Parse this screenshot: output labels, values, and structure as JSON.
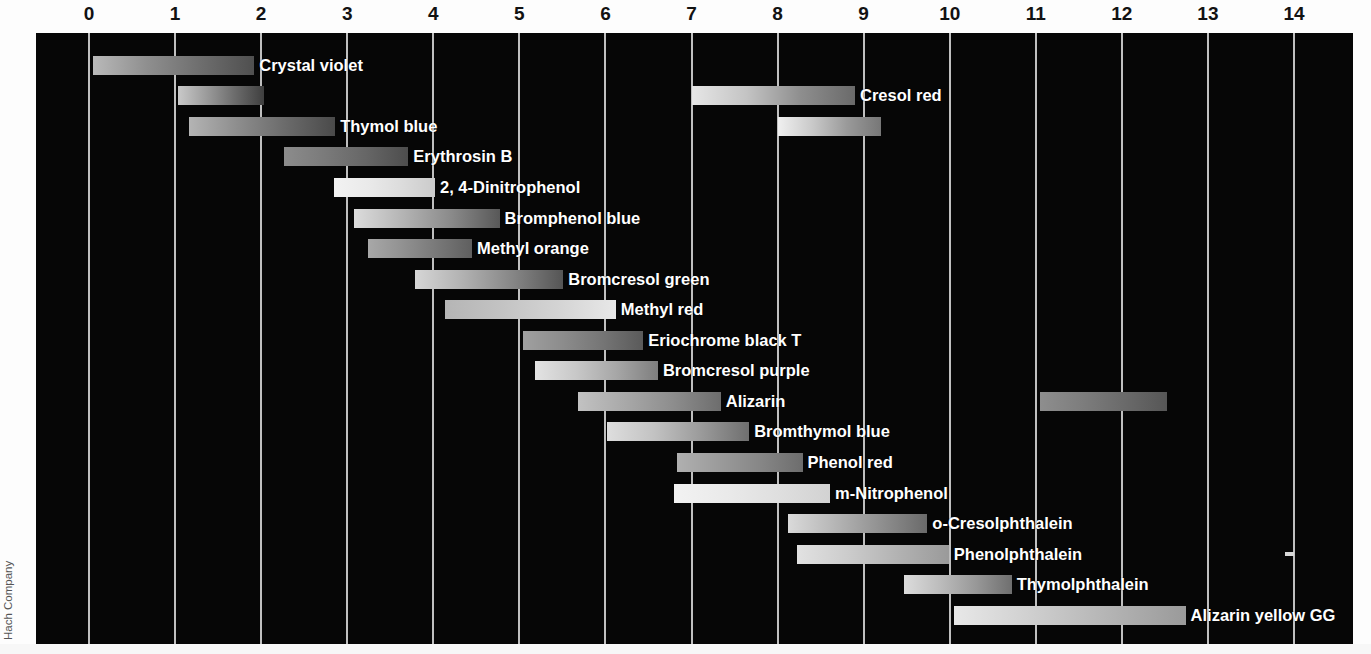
{
  "figure": {
    "credit": "Hach Company",
    "axis": {
      "title": "pH",
      "min": 0,
      "max": 14,
      "ticks": [
        0,
        1,
        2,
        3,
        4,
        5,
        6,
        7,
        8,
        9,
        10,
        11,
        12,
        13,
        14
      ],
      "tick_labels": [
        "0",
        "1",
        "2",
        "3",
        "4",
        "5",
        "6",
        "7",
        "8",
        "9",
        "10",
        "11",
        "12",
        "13",
        "14"
      ],
      "position": "top"
    },
    "colors": {
      "panel_background": "#060606",
      "gridline": "#cfcfcf",
      "label_text": "#ffffff",
      "axis_text": "#121212",
      "credit_text": "#555555"
    }
  },
  "chart_data": {
    "type": "bar",
    "orientation": "horizontal-ranges",
    "title": "",
    "subtitle": "",
    "xlabel": "pH",
    "ylabel": "",
    "xlim": [
      0,
      14
    ],
    "ylim": [
      0,
      20
    ],
    "grid": true,
    "legend": "none",
    "annotations": [
      "Hach Company"
    ],
    "categories": [
      "Crystal violet",
      "Cresol red",
      "Thymol blue",
      "Erythrosin B",
      "2, 4-Dinitrophenol",
      "Bromphenol blue",
      "Methyl orange",
      "Bromcresol green",
      "Methyl red",
      "Eriochrome black T",
      "Bromcresol purple",
      "Alizarin",
      "Bromthymol blue",
      "Phenol red",
      "m-Nitrophenol",
      "o-Cresolphthalein",
      "Phenolphthalein",
      "Thymolphthalein",
      "Alizarin yellow GG"
    ],
    "rows": [
      {
        "label": "Crystal violet",
        "label_side": "right",
        "bands": [
          {
            "start": 0.05,
            "end": 1.92,
            "gradient": [
              "#b9b9b9",
              "#8f8f8f",
              "#6e6e6e",
              "#4f4f4f"
            ]
          }
        ]
      },
      {
        "label": "Cresol red",
        "label_side": "right",
        "bands": [
          {
            "start": 1.03,
            "end": 2.03,
            "gradient": [
              "#c9c9c9",
              "#9b9b9b",
              "#6b6b6b",
              "#3f3f3f"
            ]
          },
          {
            "start": 7.0,
            "end": 8.9,
            "gradient": [
              "#e6e6e6",
              "#c4c4c4",
              "#8e8e8e",
              "#6a6a6a"
            ]
          }
        ]
      },
      {
        "label": "Thymol blue",
        "label_side": "right",
        "bands": [
          {
            "start": 1.16,
            "end": 2.86,
            "gradient": [
              "#b4b4b4",
              "#8d8d8d",
              "#6a6a6a",
              "#4a4a4a"
            ]
          },
          {
            "start": 8.0,
            "end": 9.2,
            "gradient": [
              "#f0f0f0",
              "#c9c9c9",
              "#9a9a9a",
              "#777777"
            ]
          }
        ]
      },
      {
        "label": "Erythrosin B",
        "label_side": "right",
        "bands": [
          {
            "start": 2.26,
            "end": 3.71,
            "gradient": [
              "#8c8c8c",
              "#7a7a7a",
              "#666666",
              "#4d4d4d"
            ]
          }
        ]
      },
      {
        "label": "2, 4-Dinitrophenol",
        "label_side": "right",
        "bands": [
          {
            "start": 2.85,
            "end": 4.02,
            "gradient": [
              "#f2f2f2",
              "#eaeaea",
              "#dcdcdc",
              "#cbcbcb"
            ]
          }
        ]
      },
      {
        "label": "Bromphenol blue",
        "label_side": "right",
        "bands": [
          {
            "start": 3.08,
            "end": 4.77,
            "gradient": [
              "#dcdcdc",
              "#b4b4b4",
              "#8a8a8a",
              "#585858"
            ]
          }
        ]
      },
      {
        "label": "Methyl orange",
        "label_side": "right",
        "bands": [
          {
            "start": 3.24,
            "end": 4.45,
            "gradient": [
              "#a8a8a8",
              "#919191",
              "#787878",
              "#5f5f5f"
            ]
          }
        ]
      },
      {
        "label": "Bromcresol green",
        "label_side": "right",
        "bands": [
          {
            "start": 3.79,
            "end": 5.51,
            "gradient": [
              "#d6d6d6",
              "#b0b0b0",
              "#858585",
              "#555555"
            ]
          }
        ]
      },
      {
        "label": "Methyl red",
        "label_side": "right",
        "bands": [
          {
            "start": 4.14,
            "end": 6.12,
            "gradient": [
              "#b5b5b5",
              "#c3c3c3",
              "#d4d4d4",
              "#e8e8e8"
            ]
          }
        ]
      },
      {
        "label": "Eriochrome black T",
        "label_side": "right",
        "bands": [
          {
            "start": 5.04,
            "end": 6.44,
            "gradient": [
              "#a0a0a0",
              "#8c8c8c",
              "#757575",
              "#5a5a5a"
            ]
          }
        ]
      },
      {
        "label": "Bromcresol purple",
        "label_side": "right",
        "bands": [
          {
            "start": 5.18,
            "end": 6.61,
            "gradient": [
              "#e3e3e3",
              "#c8c8c8",
              "#a6a6a6",
              "#7e7e7e"
            ]
          }
        ]
      },
      {
        "label": "Alizarin",
        "label_side": "right",
        "bands": [
          {
            "start": 5.68,
            "end": 7.34,
            "gradient": [
              "#c2c2c2",
              "#a8a8a8",
              "#8d8d8d",
              "#6d6d6d"
            ]
          },
          {
            "start": 11.05,
            "end": 12.52,
            "gradient": [
              "#8e8e8e",
              "#7d7d7d",
              "#6a6a6a",
              "#565656"
            ]
          }
        ]
      },
      {
        "label": "Bromthymol blue",
        "label_side": "right",
        "bands": [
          {
            "start": 6.02,
            "end": 7.67,
            "gradient": [
              "#dedede",
              "#c2c2c2",
              "#9a9a9a",
              "#6f6f6f"
            ]
          }
        ]
      },
      {
        "label": "Phenol red",
        "label_side": "right",
        "bands": [
          {
            "start": 6.83,
            "end": 8.29,
            "gradient": [
              "#b0b0b0",
              "#9b9b9b",
              "#868686",
              "#6d6d6d"
            ]
          }
        ]
      },
      {
        "label": "m-Nitrophenol",
        "label_side": "right",
        "bands": [
          {
            "start": 6.8,
            "end": 8.61,
            "gradient": [
              "#f2f2f2",
              "#eaeaea",
              "#dfdfdf",
              "#d2d2d2"
            ]
          }
        ]
      },
      {
        "label": "o-Cresolphthalein",
        "label_side": "right",
        "bands": [
          {
            "start": 8.12,
            "end": 9.74,
            "gradient": [
              "#dadada",
              "#b6b6b6",
              "#909090",
              "#6a6a6a"
            ]
          }
        ]
      },
      {
        "label": "Phenolphthalein",
        "label_side": "right",
        "bands": [
          {
            "start": 8.62,
            "end": 8.74,
            "gradient": [
              "#9a9a9a",
              "#9a9a9a"
            ],
            "kind": "tick"
          },
          {
            "start": 8.23,
            "end": 9.99,
            "gradient": [
              "#e2e2e2",
              "#cccccc",
              "#b2b2b2",
              "#9a9a9a"
            ]
          },
          {
            "start": 13.9,
            "end": 14.0,
            "gradient": [
              "#d8d8d8",
              "#d8d8d8"
            ],
            "kind": "tick"
          }
        ]
      },
      {
        "label": "Thymolphthalein",
        "label_side": "right",
        "bands": [
          {
            "start": 9.47,
            "end": 10.72,
            "gradient": [
              "#dcdcdc",
              "#bcbcbc",
              "#989898",
              "#6f6f6f"
            ]
          }
        ]
      },
      {
        "label": "Alizarin yellow GG",
        "label_side": "right",
        "bands": [
          {
            "start": 10.05,
            "end": 12.74,
            "gradient": [
              "#e8e8e8",
              "#cfcfcf",
              "#b4b4b4",
              "#9a9a9a"
            ]
          }
        ]
      }
    ]
  }
}
